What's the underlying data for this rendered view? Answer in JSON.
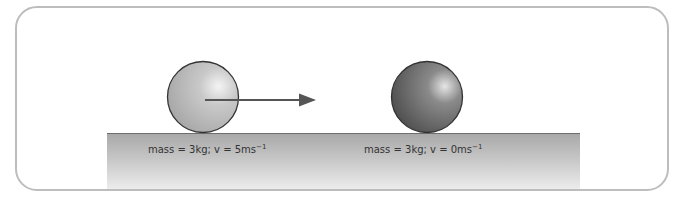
{
  "diagram": {
    "balls": [
      {
        "id": "ball-1",
        "mass_label": "mass = 3kg; v = 5ms",
        "exponent": "−1",
        "fill_style": "light-grey"
      },
      {
        "id": "ball-2",
        "mass_label": "mass = 3kg; v = 0ms",
        "exponent": "−1",
        "fill_style": "dark-grey"
      }
    ],
    "arrow": {
      "direction": "right",
      "meaning": "velocity"
    },
    "colors": {
      "frame": "#bdbdbd",
      "floor_top": "#a9a9a9",
      "floor_bottom": "#ececec",
      "arrow": "#555555"
    }
  }
}
